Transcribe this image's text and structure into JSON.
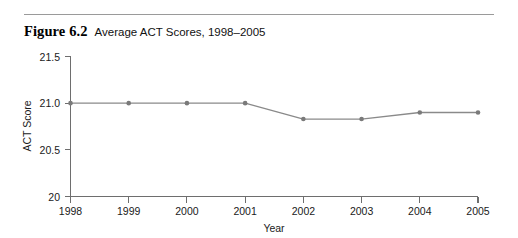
{
  "figure": {
    "number_label": "Figure 6.2",
    "caption": "Average ACT Scores, 1998–2005"
  },
  "chart_data": {
    "type": "line",
    "title": "Average ACT Scores, 1998–2005",
    "xlabel": "Year",
    "ylabel": "ACT Score",
    "categories": [
      "1998",
      "1999",
      "2000",
      "2001",
      "2002",
      "2003",
      "2004",
      "2005"
    ],
    "x": [
      1998,
      1999,
      2000,
      2001,
      2002,
      2003,
      2004,
      2005
    ],
    "values": [
      21.0,
      21.0,
      21.0,
      21.0,
      20.83,
      20.83,
      20.9,
      20.9
    ],
    "series": [
      {
        "name": "Average ACT Score",
        "values": [
          21.0,
          21.0,
          21.0,
          21.0,
          20.83,
          20.83,
          20.9,
          20.9
        ]
      }
    ],
    "ylim": [
      20,
      21.5
    ],
    "yticks": [
      20,
      20.5,
      21.0,
      21.5
    ],
    "ytick_labels": [
      "20",
      "20.5",
      "21.0",
      "21.5"
    ],
    "xtick_labels": [
      "1998",
      "1999",
      "2000",
      "2001",
      "2002",
      "2003",
      "2004",
      "2005"
    ],
    "grid": false,
    "legend": "none",
    "line_color": "#8a8a8a",
    "marker_color": "#7a7a7a",
    "axis_color": "#6e6e6e"
  },
  "axis": {
    "y_label": "ACT Score",
    "x_label": "Year",
    "y_ticks": [
      "21.5",
      "21.0",
      "20.5",
      "20"
    ],
    "x_ticks": [
      "1998",
      "1999",
      "2000",
      "2001",
      "2002",
      "2003",
      "2004",
      "2005"
    ]
  }
}
